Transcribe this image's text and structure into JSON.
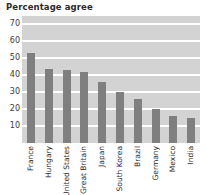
{
  "chart_data": {
    "type": "bar",
    "title": "Percentage agree",
    "xlabel": "",
    "ylabel": "",
    "ylim": [
      0,
      75
    ],
    "yticks": [
      10,
      20,
      30,
      40,
      50,
      60,
      70
    ],
    "grid": true,
    "legend": null,
    "bar_color": "#7f7f7f",
    "plot_background": "#d3d3d3",
    "gridline_color": "#ffffff",
    "categories": [
      "France",
      "Hungary",
      "United States",
      "Great Britain",
      "Japan",
      "South Korea",
      "Brazil",
      "Germany",
      "Mexico",
      "India"
    ],
    "values": [
      53,
      44,
      43,
      42,
      36,
      30,
      26,
      20,
      16,
      15
    ]
  }
}
